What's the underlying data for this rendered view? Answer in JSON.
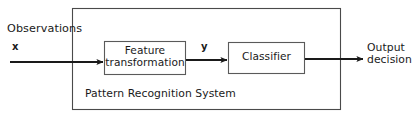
{
  "figure": {
    "type": "block-diagram",
    "background_color": "#ffffff",
    "stroke_color": "#3a3a3a",
    "box_stroke_color": "#555555",
    "arrow_color": "#1a1a1a"
  },
  "labels": {
    "observations": "Observations",
    "input_signal": "x",
    "intermediate_signal": "y",
    "system_caption": "Pattern Recognition System",
    "output_line1": "Output",
    "output_line2": "decision"
  },
  "blocks": [
    {
      "id": "feature-transformation",
      "line1": "Feature",
      "line2": "transformation",
      "x": 104,
      "y": 41,
      "w": 82,
      "h": 34
    },
    {
      "id": "classifier",
      "line1": "Classifier",
      "line2": "",
      "x": 228,
      "y": 42,
      "w": 77,
      "h": 32
    }
  ],
  "container": {
    "id": "pattern-recognition-system",
    "x": 72,
    "y": 8,
    "w": 269,
    "h": 102
  },
  "arrows": [
    {
      "id": "input-arrow",
      "from_label": "x",
      "to_block": "feature-transformation",
      "x1": 10,
      "y1": 62,
      "x2": 104,
      "y2": 62
    },
    {
      "id": "intermediate-arrow",
      "from_block": "feature-transformation",
      "to_block": "classifier",
      "x1": 186,
      "y1": 60,
      "x2": 228,
      "y2": 60
    },
    {
      "id": "output-arrow",
      "from_block": "classifier",
      "to_label": "Output decision",
      "x1": 305,
      "y1": 59,
      "x2": 364,
      "y2": 59
    }
  ]
}
